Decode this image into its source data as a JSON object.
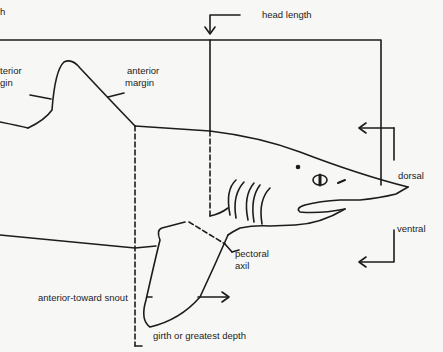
{
  "diagram": {
    "labels": {
      "top_left_fragment": "h",
      "posterior_margin_line1": "terior",
      "posterior_margin_line2": "gin",
      "anterior_margin_line1": "anterior",
      "anterior_margin_line2": "margin",
      "head_length": "head length",
      "dorsal": "dorsal",
      "ventral": "ventral",
      "pectoral_axil_line1": "pectoral",
      "pectoral_axil_line2": "axil",
      "anterior_toward_snout": "anterior-toward snout",
      "girth": "girth or greatest depth"
    },
    "colors": {
      "ink": "#1c1c1c",
      "paper": "#f7f7f5"
    }
  }
}
